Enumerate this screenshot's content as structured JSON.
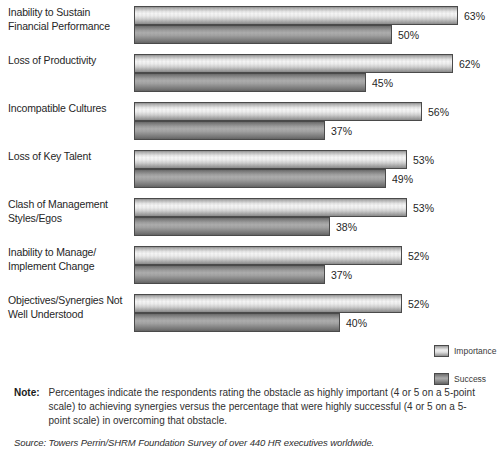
{
  "chart_data": {
    "type": "bar",
    "orientation": "horizontal",
    "title": "",
    "xlabel": "",
    "ylabel": "",
    "xlim": [
      0,
      70
    ],
    "grid": false,
    "legend_position": "bottom-right",
    "categories": [
      "Inability to Sustain Financial Performance",
      "Loss of Productivity",
      "Incompatible Cultures",
      "Loss of Key Talent",
      "Clash of Management Styles/Egos",
      "Inability to Manage/ Implement Change",
      "Objectives/Synergies Not Well Understood"
    ],
    "series": [
      {
        "name": "Importance",
        "values": [
          63,
          62,
          56,
          53,
          53,
          52,
          52
        ],
        "value_labels": [
          "63%",
          "62%",
          "56%",
          "53%",
          "53%",
          "52%",
          "52%"
        ]
      },
      {
        "name": "Success",
        "values": [
          50,
          45,
          37,
          49,
          38,
          37,
          40
        ],
        "value_labels": [
          "50%",
          "45%",
          "37%",
          "49%",
          "38%",
          "37%",
          "40%"
        ]
      }
    ]
  },
  "categories_display": [
    {
      "line1": "Inability to Sustain",
      "line2": "Financial Performance"
    },
    {
      "line1": "Loss of Productivity",
      "line2": ""
    },
    {
      "line1": "Incompatible Cultures",
      "line2": ""
    },
    {
      "line1": "Loss of Key Talent",
      "line2": ""
    },
    {
      "line1": "Clash of Management",
      "line2": "Styles/Egos"
    },
    {
      "line1": "Inability to Manage/",
      "line2": "Implement Change"
    },
    {
      "line1": "Objectives/Synergies Not",
      "line2": "Well Understood"
    }
  ],
  "legend": {
    "items": [
      {
        "label": "Importance",
        "color": "#ededed"
      },
      {
        "label": "Success",
        "color": "#9d9d9d"
      }
    ]
  },
  "note": {
    "label": "Note:",
    "text": "Percentages indicate the respondents rating the obstacle as highly important (4 or 5 on a 5-point scale) to achieving synergies versus the percentage that were highly successful (4 or 5 on a 5-point scale) in overcoming that obstacle."
  },
  "source": {
    "text": "Source: Towers Perrin/SHRM Foundation Survey of over 440 HR executives worldwide."
  }
}
